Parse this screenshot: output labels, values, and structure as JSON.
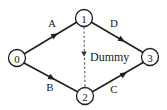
{
  "diagram": {
    "type": "directed-graph",
    "title": "",
    "background_color": "#ffffff",
    "line_color": "#1f1f1f",
    "dashed_line_color": "#555555",
    "text_color": "#1a1a1a",
    "nodes": [
      {
        "id": "0",
        "label": "0",
        "cx": 17,
        "cy": 58,
        "r": 8.5
      },
      {
        "id": "1",
        "label": "1",
        "cx": 84,
        "cy": 18,
        "r": 8.5
      },
      {
        "id": "2",
        "label": "2",
        "cx": 85,
        "cy": 96,
        "r": 8.5
      },
      {
        "id": "3",
        "label": "3",
        "cx": 150,
        "cy": 57,
        "r": 8.5
      }
    ],
    "edges": [
      {
        "id": "edge-a",
        "label": "A",
        "from": "0",
        "to": "1",
        "style": "solid",
        "label_x": 52,
        "label_y": 23,
        "x1": 24,
        "y1": 54,
        "x2": 77,
        "y2": 22,
        "arrow_x": 55,
        "arrow_y": 35,
        "arrow_angle": -31
      },
      {
        "id": "edge-b",
        "label": "B",
        "from": "0",
        "to": "2",
        "style": "solid",
        "label_x": 50,
        "label_y": 87,
        "x1": 24,
        "y1": 63,
        "x2": 78,
        "y2": 92,
        "arrow_x": 52,
        "arrow_y": 78,
        "arrow_angle": 28
      },
      {
        "id": "edge-d",
        "label": "D",
        "from": "1",
        "to": "3",
        "style": "solid",
        "label_x": 114,
        "label_y": 23,
        "x1": 91,
        "y1": 22,
        "x2": 144,
        "y2": 53,
        "arrow_x": 122,
        "arrow_y": 40,
        "arrow_angle": 30
      },
      {
        "id": "edge-c",
        "label": "C",
        "from": "2",
        "to": "3",
        "style": "solid",
        "label_x": 114,
        "label_y": 89,
        "x1": 92,
        "y1": 92,
        "x2": 144,
        "y2": 62,
        "arrow_x": 124,
        "arrow_y": 74,
        "arrow_angle": -30
      },
      {
        "id": "edge-dummy",
        "label": "Dummy",
        "from": "1",
        "to": "2",
        "style": "dashed",
        "label_x": 90,
        "label_y": 57,
        "x1": 84,
        "y1": 27,
        "x2": 85,
        "y2": 88,
        "arrow_x": 84,
        "arrow_y": 54,
        "arrow_angle": 90
      }
    ]
  }
}
